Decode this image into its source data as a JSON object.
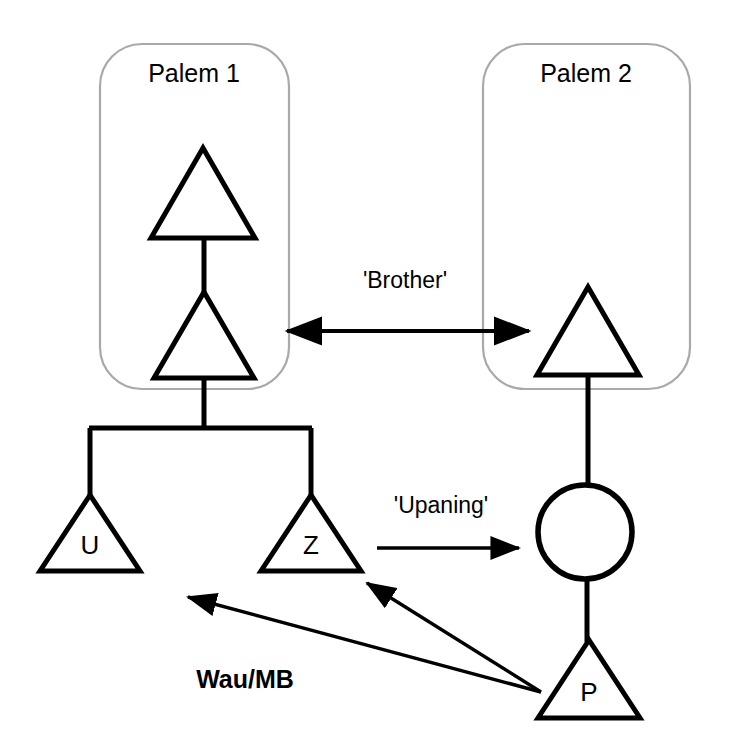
{
  "diagram": {
    "type": "kinship-diagram",
    "background_color": "#ffffff",
    "line_color": "#000000",
    "group_border_color": "#a9a9a9",
    "groups": [
      {
        "id": "palem-1",
        "label": "Palem 1",
        "label_x": 194,
        "label_y": 82,
        "box": {
          "x": 100,
          "y": 44,
          "width": 189,
          "height": 345,
          "radius": 42
        }
      },
      {
        "id": "palem-2",
        "label": "Palem 2",
        "label_x": 586,
        "label_y": 82,
        "box": {
          "x": 483,
          "y": 44,
          "width": 207,
          "height": 345,
          "radius": 42
        }
      }
    ],
    "symbols": [
      {
        "id": "male-p1-grandfather",
        "shape": "triangle",
        "label": "",
        "cx": 203,
        "cy": 193,
        "half_width": 52,
        "height": 90
      },
      {
        "id": "male-p1-father",
        "shape": "triangle",
        "label": "",
        "cx": 204,
        "cy": 335,
        "half_width": 50,
        "height": 86
      },
      {
        "id": "male-u",
        "shape": "triangle",
        "label": "U",
        "cx": 90,
        "cy": 533,
        "half_width": 50,
        "height": 76
      },
      {
        "id": "male-z",
        "shape": "triangle",
        "label": "Z",
        "cx": 311,
        "cy": 533,
        "half_width": 50,
        "height": 76
      },
      {
        "id": "male-p2-brother",
        "shape": "triangle",
        "label": "",
        "cx": 588,
        "cy": 331,
        "half_width": 51,
        "height": 88
      },
      {
        "id": "female-wife",
        "shape": "circle",
        "label": "",
        "cx": 585,
        "cy": 532,
        "radius": 47
      },
      {
        "id": "male-p",
        "shape": "triangle",
        "label": "P",
        "cx": 589,
        "cy": 679,
        "half_width": 51,
        "height": 78
      }
    ],
    "descent_lines": [
      {
        "id": "line-grandfather-to-father",
        "x1": 204,
        "y1": 238,
        "x2": 204,
        "y2": 292
      },
      {
        "id": "line-father-to-sibling-bar",
        "x1": 204,
        "y1": 378,
        "x2": 204,
        "y2": 428
      },
      {
        "id": "sibling-bar-u-z",
        "x1": 89,
        "y1": 428,
        "x2": 312,
        "y2": 428
      },
      {
        "id": "line-bar-to-u",
        "x1": 90,
        "y1": 428,
        "x2": 90,
        "y2": 497
      },
      {
        "id": "line-bar-to-z",
        "x1": 311,
        "y1": 428,
        "x2": 311,
        "y2": 497
      },
      {
        "id": "line-brother-to-wife",
        "x1": 588,
        "y1": 375,
        "x2": 588,
        "y2": 486
      },
      {
        "id": "line-wife-to-p",
        "x1": 587,
        "y1": 578,
        "x2": 587,
        "y2": 642
      }
    ],
    "relations": [
      {
        "id": "brother-relation",
        "label": "'Brother'",
        "label_x": 405,
        "label_y": 288,
        "arrow": "double",
        "x1": 287,
        "y1": 331,
        "x2": 529,
        "y2": 331
      },
      {
        "id": "upaning-relation",
        "label": "'Upaning'",
        "label_x": 441,
        "label_y": 513,
        "arrow": "single",
        "x1": 377,
        "y1": 548,
        "x2": 519,
        "y2": 548
      },
      {
        "id": "wau-mb-relation-to-u",
        "label": "Wau/MB",
        "label_x": 245,
        "label_y": 688,
        "arrow": "single",
        "x1": 541,
        "y1": 692,
        "x2": 188,
        "y2": 597
      },
      {
        "id": "wau-mb-relation-to-z",
        "label": "",
        "label_x": 0,
        "label_y": 0,
        "arrow": "single",
        "x1": 541,
        "y1": 692,
        "x2": 367,
        "y2": 583
      }
    ]
  }
}
